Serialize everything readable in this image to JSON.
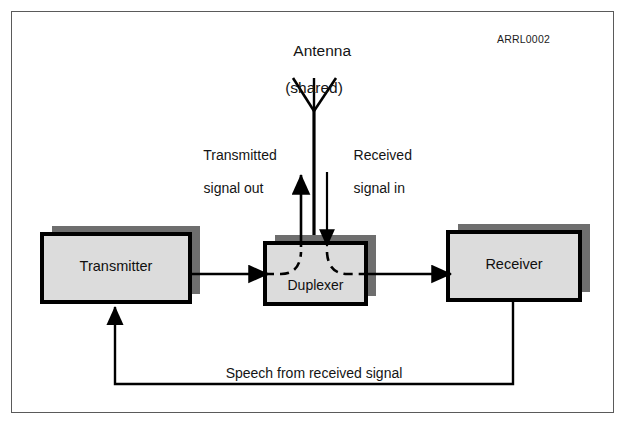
{
  "figure": {
    "code_label": "ARRL0002",
    "antenna": {
      "title": "Antenna",
      "subtitle": "(shared)",
      "icon": "antenna-dipole-icon"
    },
    "blocks": [
      {
        "id": "transmitter",
        "label": "Transmitter"
      },
      {
        "id": "duplexer",
        "label": "Duplexer"
      },
      {
        "id": "receiver",
        "label": "Receiver"
      }
    ],
    "signal_labels": {
      "transmitted": "Transmitted\nsignal out",
      "transmitted_line1": "Transmitted",
      "transmitted_line2": "signal out",
      "received": "Received\nsignal in",
      "received_line1": "Received",
      "received_line2": "signal in",
      "feedback": "Speech from received signal"
    },
    "colors": {
      "box_fill": "#dcdcdc",
      "box_stroke": "#000000",
      "box_shadow": "#6e6e6e",
      "frame_stroke": "#5a5a5a",
      "line": "#000000",
      "text": "#121212",
      "background": "#ffffff"
    }
  }
}
